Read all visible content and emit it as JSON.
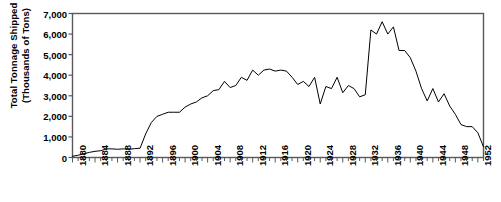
{
  "chart_data": {
    "type": "line",
    "title": "",
    "xlabel": "",
    "ylabel": "Total Tonnage Shipped\n(Thousands of Tons)",
    "ylabel_line1": "Total Tonnage Shipped",
    "ylabel_line2": "(Thousands of Tons)",
    "ylim": [
      0,
      7000
    ],
    "ytick_values": [
      0,
      1000,
      2000,
      3000,
      4000,
      5000,
      6000,
      7000
    ],
    "ytick_labels": [
      "0",
      "1,000",
      "2,000",
      "3,000",
      "4,000",
      "5,000",
      "6,000",
      "7,000"
    ],
    "xlim": [
      1880,
      1953
    ],
    "xtick_labels": [
      "1880",
      "1884",
      "1888",
      "1892",
      "1896",
      "1900",
      "1904",
      "1908",
      "1912",
      "1916",
      "1920",
      "1924",
      "1928",
      "1932",
      "1936",
      "1940",
      "1944",
      "1948",
      "1952"
    ],
    "xtick_values": [
      1880,
      1884,
      1888,
      1892,
      1896,
      1900,
      1904,
      1908,
      1912,
      1916,
      1920,
      1924,
      1928,
      1932,
      1936,
      1940,
      1944,
      1948,
      1952
    ],
    "xtick_minor_step": 1,
    "grid": false,
    "legend": false,
    "line_color": "#000000",
    "line_width": 1,
    "x": [
      1880,
      1881,
      1882,
      1883,
      1884,
      1885,
      1886,
      1887,
      1888,
      1889,
      1890,
      1891,
      1892,
      1893,
      1894,
      1895,
      1896,
      1897,
      1898,
      1899,
      1900,
      1901,
      1902,
      1903,
      1904,
      1905,
      1906,
      1907,
      1908,
      1909,
      1910,
      1911,
      1912,
      1913,
      1914,
      1915,
      1916,
      1917,
      1918,
      1919,
      1920,
      1921,
      1922,
      1923,
      1924,
      1925,
      1926,
      1927,
      1928,
      1929,
      1930,
      1931,
      1932,
      1933,
      1934,
      1935,
      1936,
      1937,
      1938,
      1939,
      1940,
      1941,
      1942,
      1943,
      1944,
      1945,
      1946,
      1947,
      1948,
      1949,
      1950,
      1951,
      1952,
      1953
    ],
    "values": [
      60,
      110,
      180,
      250,
      300,
      330,
      420,
      420,
      400,
      420,
      400,
      430,
      450,
      1150,
      1700,
      2000,
      2100,
      2200,
      2200,
      2200,
      2450,
      2600,
      2700,
      2900,
      3000,
      3250,
      3300,
      3700,
      3400,
      3500,
      3900,
      3750,
      4250,
      4000,
      4250,
      4300,
      4200,
      4250,
      4200,
      3900,
      3550,
      3700,
      3450,
      3900,
      2600,
      3450,
      3350,
      3900,
      3150,
      3500,
      3350,
      2950,
      3050,
      6200,
      6000,
      6600,
      6000,
      6350,
      5200,
      5200,
      4850,
      4200,
      3350,
      2750,
      3350,
      2700,
      3100,
      2500,
      2100,
      1600,
      1500,
      1500,
      1200,
      520
    ]
  }
}
